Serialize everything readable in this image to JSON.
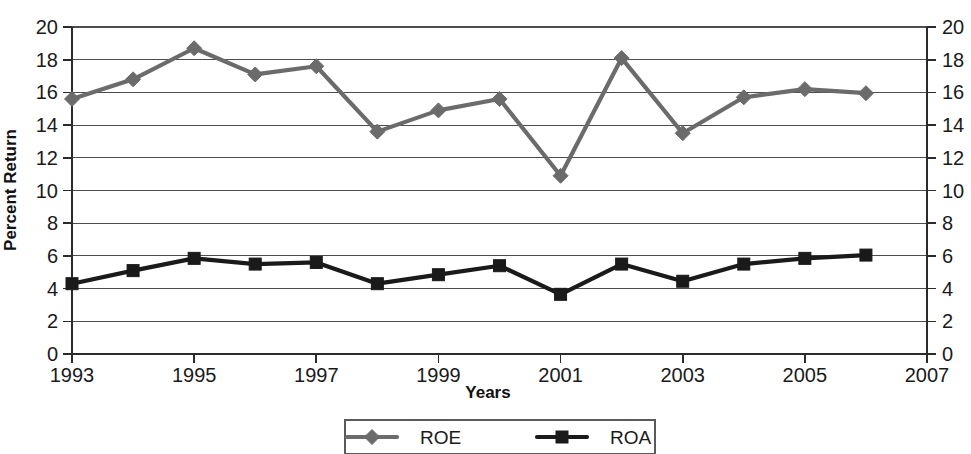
{
  "chart_data": {
    "type": "line",
    "title": "",
    "xlabel": "Years",
    "ylabel": "Percent Return",
    "x": [
      1993,
      1994,
      1995,
      1996,
      1997,
      1998,
      1999,
      2000,
      2001,
      2002,
      2003,
      2004,
      2005,
      2006
    ],
    "xlim": [
      1993,
      2007
    ],
    "ylim": [
      0,
      20
    ],
    "x_tick_labels": [
      "1993",
      "1995",
      "1997",
      "1999",
      "2001",
      "2003",
      "2005",
      "2007"
    ],
    "x_ticks": [
      1993,
      1995,
      1997,
      1999,
      2001,
      2003,
      2005,
      2007
    ],
    "y_ticks": [
      0,
      2,
      4,
      6,
      8,
      10,
      12,
      14,
      16,
      18,
      20
    ],
    "y_tick_labels": [
      "0",
      "2",
      "4",
      "6",
      "8",
      "10",
      "12",
      "14",
      "16",
      "18",
      "20"
    ],
    "right_axis": true,
    "right_y_tick_labels": [
      "0",
      "2",
      "4",
      "6",
      "8",
      "10",
      "12",
      "14",
      "16",
      "18",
      "20"
    ],
    "grid": "horizontal",
    "legend_position": "bottom-center",
    "series": [
      {
        "name": "ROE",
        "marker": "diamond",
        "color": "#6b6b6b",
        "values": [
          15.6,
          16.8,
          18.7,
          17.1,
          17.6,
          13.6,
          14.9,
          15.6,
          10.9,
          18.1,
          13.5,
          15.7,
          16.2,
          15.95
        ]
      },
      {
        "name": "ROA",
        "marker": "square",
        "color": "#1a1a1a",
        "values": [
          4.3,
          5.1,
          5.85,
          5.5,
          5.6,
          4.3,
          4.85,
          5.4,
          3.65,
          5.5,
          4.45,
          5.5,
          5.85,
          6.05
        ]
      }
    ]
  },
  "legend": {
    "entries": [
      {
        "label": "ROE"
      },
      {
        "label": "ROA"
      }
    ]
  },
  "axes": {
    "y_axis_title": "Percent Return",
    "x_axis_title": "Years"
  }
}
